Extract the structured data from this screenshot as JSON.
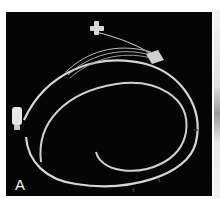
{
  "figure": {
    "panel_label": "A",
    "colors": {
      "background": "#050505",
      "catheter": "#d8d8d8",
      "margin": "#ffffff"
    }
  }
}
